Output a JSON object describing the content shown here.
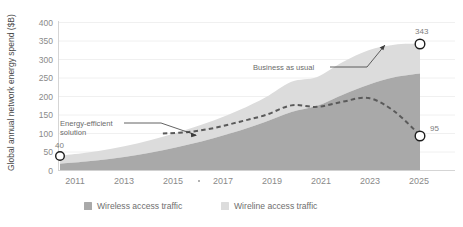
{
  "chart_data": {
    "type": "area",
    "title": "",
    "subtitle": "",
    "xlabel": "",
    "ylabel": "Global annual network energy spend ($B)",
    "x": [
      2011,
      2012,
      2013,
      2014,
      2015,
      2016,
      2017,
      2018,
      2019,
      2020,
      2021,
      2022,
      2023,
      2024,
      2025
    ],
    "xticklabels": [
      "2011",
      "2013",
      "2015",
      "2017",
      "2019",
      "2021",
      "2023",
      "2025"
    ],
    "xtickvalues": [
      2011,
      2013,
      2015,
      2017,
      2019,
      2021,
      2023,
      2025
    ],
    "xlim": [
      2011,
      2025
    ],
    "ylim": [
      0,
      400
    ],
    "yticklabels": [
      "0",
      "50",
      "100",
      "150",
      "200",
      "250",
      "300",
      "350",
      "400"
    ],
    "ytickvalues": [
      0,
      50,
      100,
      150,
      200,
      250,
      300,
      350,
      400
    ],
    "grid": true,
    "stacked": true,
    "legend_position": "bottom",
    "series": [
      {
        "name": "Wireless access traffic",
        "color": "#a9a9a9",
        "values": [
          18,
          24,
          32,
          42,
          55,
          70,
          88,
          108,
          132,
          158,
          175,
          205,
          232,
          252,
          262
        ]
      },
      {
        "name": "Wireline access traffic",
        "color": "#dcdcdc",
        "values": [
          22,
          24,
          27,
          31,
          36,
          42,
          48,
          56,
          66,
          82,
          78,
          88,
          93,
          88,
          81
        ]
      }
    ],
    "lines": [
      {
        "name": "Energy-efficient solution",
        "style": "dashed",
        "color": "#5a5a5a",
        "x": [
          2015,
          2016,
          2017,
          2018,
          2019,
          2020,
          2021,
          2022,
          2023,
          2024,
          2025
        ],
        "values": [
          100,
          104,
          115,
          132,
          150,
          176,
          172,
          186,
          196,
          160,
          95
        ]
      }
    ],
    "annotations": [
      {
        "text": "Business as usual",
        "x": 2021,
        "y": 300
      },
      {
        "text": "Energy-efficient",
        "x": 2012.6,
        "y": 142
      },
      {
        "text": "solution",
        "x": 2012.6,
        "y": 130
      }
    ],
    "point_labels": [
      {
        "label": "40",
        "x": 2011,
        "y": 40
      },
      {
        "label": "343",
        "x": 2025,
        "y": 343
      },
      {
        "label": "95",
        "x": 2025,
        "y": 95
      }
    ]
  },
  "legend": {
    "items": [
      {
        "label": "Wireless access traffic",
        "color": "#a9a9a9"
      },
      {
        "label": "Wireline access traffic",
        "color": "#dcdcdc"
      }
    ]
  },
  "annotation_labels": {
    "business_as_usual": "Business as usual",
    "energy_efficient_line1": "Energy-efficient",
    "energy_efficient_line2": "solution"
  },
  "point_labels": {
    "start": "40",
    "top_end": "343",
    "bottom_end": "95"
  },
  "axis": {
    "y_title": "Global annual network energy spend ($B)"
  }
}
